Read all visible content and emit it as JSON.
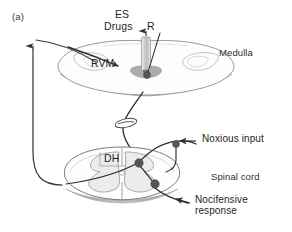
{
  "figure": {
    "panel_label": "(a)",
    "background_color": "#ffffff",
    "ink_color": "#2b2b2b"
  },
  "labels": {
    "panel": "(a)",
    "es": "ES",
    "drugs": "Drugs",
    "recording": "R",
    "rvm": "RVM",
    "medulla": "Medulla",
    "dh": "DH",
    "spinal_cord": "Spinal cord",
    "noxious_input": "Noxious input",
    "nocifensive_response": "Nocifensive\nresponse"
  },
  "label_positions": {
    "panel": {
      "x": 12,
      "y": 12
    },
    "es": {
      "x": 115,
      "y": 14
    },
    "drugs": {
      "x": 104,
      "y": 26
    },
    "recording": {
      "x": 146,
      "y": 26
    },
    "rvm": {
      "x": 92,
      "y": 63
    },
    "medulla": {
      "x": 220,
      "y": 52
    },
    "dh": {
      "x": 104,
      "y": 158
    },
    "spinal_cord": {
      "x": 212,
      "y": 176
    },
    "noxious_input": {
      "x": 203,
      "y": 137
    },
    "nocifensive_response": {
      "x": 196,
      "y": 199
    }
  },
  "structures": {
    "medulla": {
      "name": "medulla-cross-section",
      "outline_color": "#7f7f7f",
      "fill_color": "#fcfcfc",
      "ventral_band_color": "#9a9a9a",
      "center_x": 146,
      "center_y": 66,
      "half_width": 88,
      "half_height": 26
    },
    "spinal_cord": {
      "name": "spinal-cord-cross-section",
      "outline_color": "#6f6f6f",
      "fill_color": "#fdfdfd",
      "gray_matter_color": "#e8e8e8",
      "ventral_band_color": "#a8a8a8",
      "center_x": 122,
      "center_y": 175,
      "half_width": 58,
      "half_height": 28
    },
    "cannula": {
      "name": "es-drugs-cannula",
      "body_color": "#d6d6d6",
      "edge_color": "#8a8a8a",
      "tip_color": "#6a6a6a",
      "x": 146,
      "top_y": 36,
      "bottom_y": 72
    }
  },
  "neurons": [
    {
      "name": "rvm-neuron",
      "x": 147,
      "y": 75,
      "r": 3.4,
      "color": "#5a5a5a"
    },
    {
      "name": "primary-afferent-soma",
      "x": 176,
      "y": 144,
      "r": 3.4,
      "color": "#5a5a5a"
    },
    {
      "name": "dorsal-horn-neuron",
      "x": 139,
      "y": 163,
      "r": 4.2,
      "color": "#555555"
    },
    {
      "name": "ventral-horn-motoneuron",
      "x": 155,
      "y": 184,
      "r": 4.2,
      "color": "#555555"
    }
  ],
  "pathways": [
    {
      "name": "ascending-pathway",
      "description": "spinothalamic ascending projection curving up the left side",
      "arrow": "up"
    },
    {
      "name": "descending-pathway",
      "description": "RVM descending projection to spinal dorsal horn",
      "arrow": "down"
    },
    {
      "name": "noxious-input-afferent",
      "description": "primary afferent carrying noxious input into dorsal horn",
      "arrow": "left"
    },
    {
      "name": "nocifensive-output",
      "description": "motor output producing nocifensive response",
      "arrow": "left"
    }
  ],
  "break_symbol": {
    "name": "pathway-break-ellipse",
    "x": 126,
    "y": 123,
    "rx": 11,
    "ry": 4.2
  }
}
